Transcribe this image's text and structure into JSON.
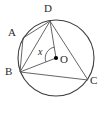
{
  "figure": {
    "type": "circle-geometry-diagram",
    "labels": {
      "A": "A",
      "B": "B",
      "C": "C",
      "D": "D",
      "O": "O",
      "angle": "x"
    },
    "colors": {
      "stroke": "#4a4a4a",
      "circle_stroke": "#3d3d3d",
      "label": "#2b2b2b",
      "background": "#ffffff",
      "center_dot": "#000000"
    },
    "geometry": {
      "circle": {
        "cx": 56,
        "cy": 58,
        "r": 38
      },
      "points": {
        "A": {
          "x": 23,
          "y": 38
        },
        "B": {
          "x": 20,
          "y": 72
        },
        "C": {
          "x": 88,
          "y": 80
        },
        "D": {
          "x": 50,
          "y": 21
        },
        "O": {
          "x": 56,
          "y": 58
        }
      },
      "segments": [
        {
          "name": "chord-A-D",
          "from": "A",
          "to": "D"
        },
        {
          "name": "chord-A-B",
          "from": "A",
          "to": "B"
        },
        {
          "name": "chord-B-D",
          "from": "B",
          "to": "D"
        },
        {
          "name": "chord-B-C",
          "from": "B",
          "to": "C"
        },
        {
          "name": "chord-D-C",
          "from": "D",
          "to": "C"
        },
        {
          "name": "radius-O-D",
          "from": "O",
          "to": "D"
        },
        {
          "name": "radius-O-B",
          "from": "O",
          "to": "B"
        }
      ],
      "angle_arc": {
        "name": "central-angle-x",
        "vertex": "O",
        "between": [
          "D",
          "B"
        ],
        "radius": 11
      }
    }
  }
}
